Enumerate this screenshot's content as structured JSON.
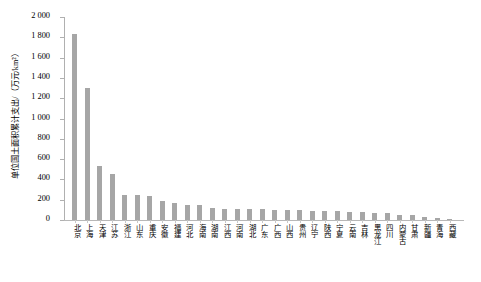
{
  "chart_data": {
    "type": "bar",
    "title": "",
    "subtitle": "",
    "xlabel": "",
    "ylabel": "单位国土面积累计支出/（万元/km²）",
    "ylim": [
      0,
      2000
    ],
    "ytick_step": 200,
    "ytick_labels": [
      "2 000",
      "1 800",
      "1 600",
      "1 400",
      "1 200",
      "1 000",
      "800",
      "600",
      "400",
      "200",
      "0"
    ],
    "ytick_values": [
      2000,
      1800,
      1600,
      1400,
      1200,
      1000,
      800,
      600,
      400,
      200,
      0
    ],
    "grid": false,
    "legend": "none",
    "bar_color": "#a6a6a6",
    "categories": [
      "北京",
      "上海",
      "天津",
      "江苏",
      "浙江",
      "山东",
      "重庆",
      "安徽",
      "福建",
      "河北",
      "海南",
      "湖南",
      "江西",
      "河南",
      "湖北",
      "广东",
      "广西",
      "山西",
      "贵州",
      "辽宁",
      "陕西",
      "宁夏",
      "云南",
      "吉林",
      "黑龙江",
      "四川",
      "内蒙古",
      "甘肃",
      "新疆",
      "青海",
      "西藏"
    ],
    "values": [
      1830,
      1300,
      530,
      455,
      250,
      245,
      240,
      185,
      165,
      150,
      148,
      120,
      112,
      110,
      108,
      105,
      100,
      98,
      95,
      92,
      88,
      85,
      80,
      76,
      70,
      66,
      52,
      45,
      30,
      18,
      8
    ]
  }
}
